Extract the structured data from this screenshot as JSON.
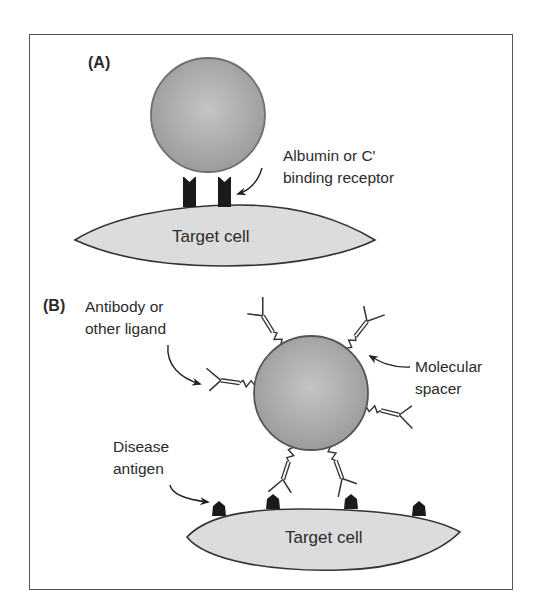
{
  "figure": {
    "panels": [
      {
        "id": "A",
        "label": "(A)",
        "target_cell_label": "Target cell",
        "receptor_label_line1": "Albumin or C'",
        "receptor_label_line2": "binding receptor"
      },
      {
        "id": "B",
        "label": "(B)",
        "target_cell_label": "Target cell",
        "ligand_label_line1": "Antibody or",
        "ligand_label_line2": "other ligand",
        "spacer_label_line1": "Molecular",
        "spacer_label_line2": "spacer",
        "antigen_label_line1": "Disease",
        "antigen_label_line2": "antigen"
      }
    ],
    "colors": {
      "particle_fill": "#a9a9a9",
      "particle_stroke": "#6f6f6f",
      "cell_fill": "#dcdcdc",
      "cell_stroke": "#333333",
      "receptor": "#1a1a1a",
      "line": "#333333"
    },
    "counts": {
      "panel_a_receptors": 2,
      "panel_b_ligands": 6,
      "panel_b_antigens": 4
    }
  }
}
